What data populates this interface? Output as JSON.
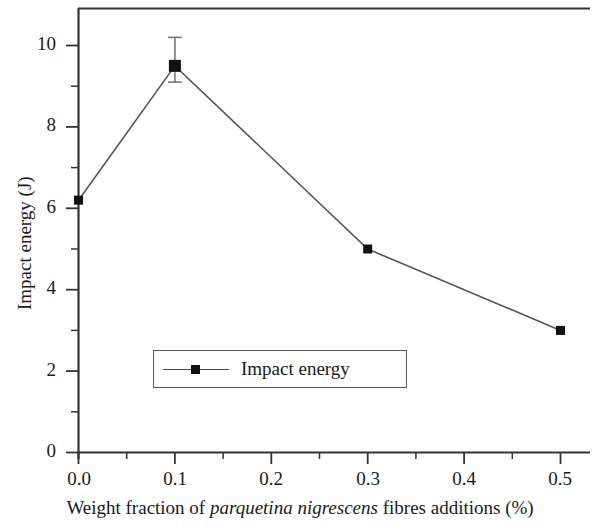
{
  "chart_data": {
    "type": "line",
    "title": "",
    "xlabel_parts": {
      "before": "Weight fraction of ",
      "species": "parquetina nigrescens",
      "after": " fibres additions (%)"
    },
    "xlabel": "Weight fraction of parquetina nigrescens fibres additions (%)",
    "ylabel": "Impact energy (J)",
    "x": [
      0.0,
      0.1,
      0.3,
      0.5
    ],
    "values": [
      6.2,
      9.5,
      5.0,
      3.0
    ],
    "errors": [
      null,
      {
        "upper": 10.2,
        "lower": 9.1
      },
      null,
      null
    ],
    "series": [
      {
        "name": "Impact energy",
        "values": [
          6.2,
          9.5,
          5.0,
          3.0
        ]
      }
    ],
    "xlim": [
      0.0,
      0.5
    ],
    "ylim": [
      0,
      10.6
    ],
    "xticks": [
      0.0,
      0.1,
      0.2,
      0.3,
      0.4,
      0.5
    ],
    "xticklabels": [
      "0.0",
      "0.1",
      "0.2",
      "0.3",
      "0.4",
      "0.5"
    ],
    "yticks": [
      0,
      2,
      4,
      6,
      8,
      10
    ],
    "yticklabels": [
      "0",
      "2",
      "4",
      "6",
      "8",
      "10"
    ],
    "y_minor_ticks": [
      1,
      3,
      5,
      7,
      9
    ],
    "x_minor_ticks": [
      0.05,
      0.15,
      0.25,
      0.35,
      0.45
    ],
    "grid": false,
    "legend": {
      "position": "inside-lower-left",
      "entries": [
        {
          "label": "Impact energy",
          "marker": "square",
          "color": "#111111",
          "line_color": "#4a4a4a"
        }
      ]
    },
    "line_color": "#555555",
    "marker_color": "#111111",
    "axis_color": "#333333"
  }
}
